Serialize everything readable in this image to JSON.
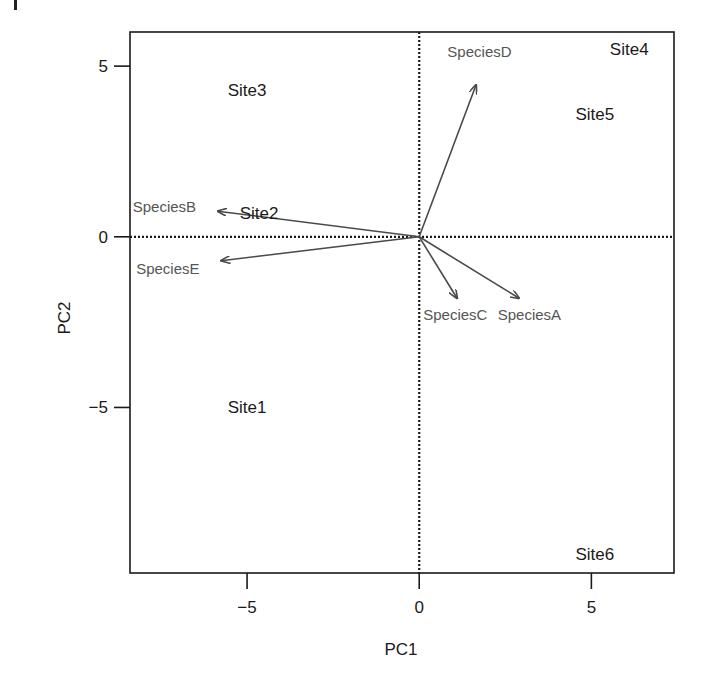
{
  "chart_data": {
    "type": "scatter",
    "subtype": "pca-biplot",
    "title": "",
    "xlabel": "PC1",
    "ylabel": "PC2",
    "xlim": [
      -8.4,
      7.4
    ],
    "ylim": [
      -9.85,
      6.0
    ],
    "xticks": [
      -5,
      0,
      5
    ],
    "yticks": [
      -5,
      0,
      5
    ],
    "xtick_labels": [
      "−5",
      "0",
      "5"
    ],
    "ytick_labels": [
      "−5",
      "0",
      "5"
    ],
    "grid": false,
    "reference_lines": {
      "x0": true,
      "y0": true,
      "style": "dotted"
    },
    "legend": null,
    "sites": [
      {
        "label": "Site1",
        "x": -5.0,
        "y": -5.0
      },
      {
        "label": "Site2",
        "x": -4.65,
        "y": 0.7
      },
      {
        "label": "Site3",
        "x": -5.0,
        "y": 4.3
      },
      {
        "label": "Site4",
        "x": 6.1,
        "y": 5.5
      },
      {
        "label": "Site5",
        "x": 5.1,
        "y": 3.6
      },
      {
        "label": "Site6",
        "x": 5.1,
        "y": -9.3
      }
    ],
    "species_vectors": [
      {
        "label": "SpeciesA",
        "x": 2.9,
        "y": -1.8,
        "label_x": 3.2,
        "label_y": -2.25
      },
      {
        "label": "SpeciesB",
        "x": -5.85,
        "y": 0.75,
        "label_x": -7.4,
        "label_y": 0.9
      },
      {
        "label": "SpeciesC",
        "x": 1.1,
        "y": -1.8,
        "label_x": 1.05,
        "label_y": -2.25
      },
      {
        "label": "SpeciesD",
        "x": 1.65,
        "y": 4.45,
        "label_x": 1.75,
        "label_y": 5.45
      },
      {
        "label": "SpeciesE",
        "x": -5.75,
        "y": -0.7,
        "label_x": -7.3,
        "label_y": -0.9
      }
    ],
    "colors": {
      "axis": "#1a1a1a",
      "site_text": "#1a1a1a",
      "species_text": "#555555",
      "arrow": "#4a4a4a"
    }
  }
}
